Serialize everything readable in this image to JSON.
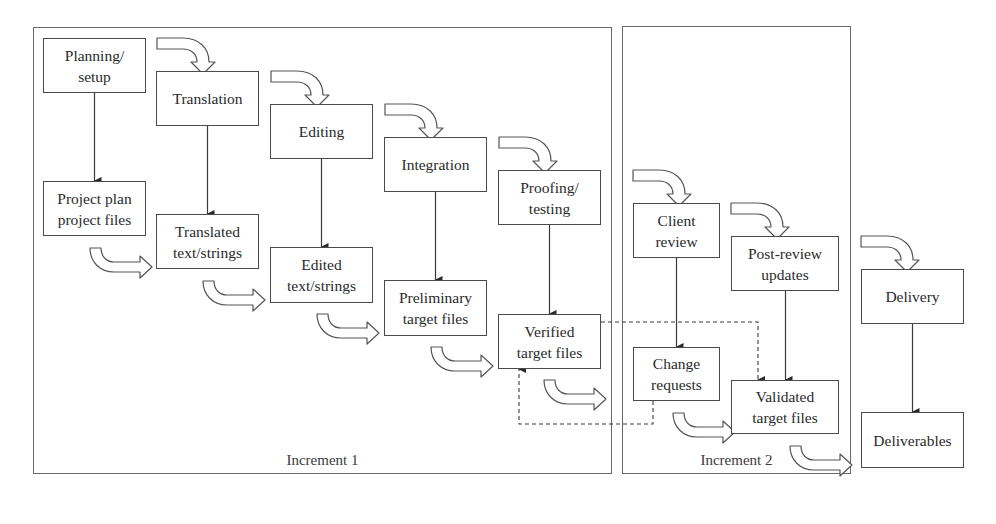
{
  "diagram": {
    "type": "process-flow",
    "frames": [
      {
        "id": "increment1",
        "label": "Increment 1"
      },
      {
        "id": "increment2",
        "label": "Increment 2"
      }
    ],
    "nodes": {
      "planning": "Planning/\nsetup",
      "project_plan": "Project plan\nproject files",
      "translation": "Translation",
      "translated": "Translated\ntext/strings",
      "editing": "Editing",
      "edited": "Edited\ntext/strings",
      "integration": "Integration",
      "preliminary": "Preliminary\ntarget files",
      "proofing": "Proofing/\ntesting",
      "verified": "Verified\ntarget files",
      "client_review": "Client\nreview",
      "change_requests": "Change\nrequests",
      "post_review": "Post-review\nupdates",
      "validated": "Validated\ntarget files",
      "delivery": "Delivery",
      "deliverables": "Deliverables"
    },
    "edges": [
      {
        "from": "Planning/setup",
        "to": "Project plan project files",
        "style": "solid-arrow"
      },
      {
        "from": "Translation",
        "to": "Translated text/strings",
        "style": "solid-arrow"
      },
      {
        "from": "Editing",
        "to": "Edited text/strings",
        "style": "solid-arrow"
      },
      {
        "from": "Integration",
        "to": "Preliminary target files",
        "style": "solid-arrow"
      },
      {
        "from": "Proofing/testing",
        "to": "Verified target files",
        "style": "solid-arrow"
      },
      {
        "from": "Client review",
        "to": "Change requests",
        "style": "solid-arrow"
      },
      {
        "from": "Post-review updates",
        "to": "Validated target files",
        "style": "solid-arrow"
      },
      {
        "from": "Delivery",
        "to": "Deliverables",
        "style": "solid-arrow"
      },
      {
        "from": "Verified target files",
        "to": "Validated target files",
        "style": "dashed-arrow"
      },
      {
        "from": "Change requests",
        "to": "Verified target files",
        "style": "dashed-arrow"
      }
    ],
    "colors": {
      "line": "#4a4a4a",
      "frame": "#6a6a6a",
      "text": "#2a2a2a",
      "background": "#ffffff"
    }
  }
}
